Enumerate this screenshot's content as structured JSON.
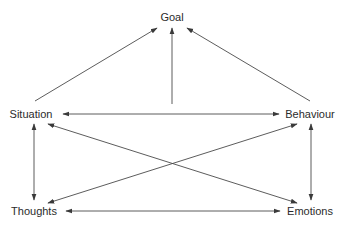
{
  "diagram": {
    "type": "flow-network",
    "nodes": [
      {
        "id": "goal",
        "label": "Goal",
        "x": 172,
        "y": 17
      },
      {
        "id": "situation",
        "label": "Situation",
        "x": 31,
        "y": 114
      },
      {
        "id": "behaviour",
        "label": "Behaviour",
        "x": 310,
        "y": 114
      },
      {
        "id": "thoughts",
        "label": "Thoughts",
        "x": 34,
        "y": 211
      },
      {
        "id": "emotions",
        "label": "Emotions",
        "x": 310,
        "y": 211
      }
    ],
    "edges": [
      {
        "from": "situation",
        "to": "goal",
        "direction": "forward",
        "x1": 35,
        "y1": 101,
        "x2": 157,
        "y2": 28
      },
      {
        "from": "situation-behaviour-link",
        "to": "goal",
        "direction": "forward",
        "x1": 172,
        "y1": 104,
        "x2": 172,
        "y2": 28
      },
      {
        "from": "behaviour",
        "to": "goal",
        "direction": "forward",
        "x1": 310,
        "y1": 101,
        "x2": 187,
        "y2": 28
      },
      {
        "from": "situation",
        "to": "behaviour",
        "direction": "both",
        "x1": 63,
        "y1": 114,
        "x2": 279,
        "y2": 114
      },
      {
        "from": "situation",
        "to": "thoughts",
        "direction": "both",
        "x1": 34,
        "y1": 124,
        "x2": 34,
        "y2": 200
      },
      {
        "from": "behaviour",
        "to": "emotions",
        "direction": "both",
        "x1": 311,
        "y1": 124,
        "x2": 311,
        "y2": 200
      },
      {
        "from": "situation",
        "to": "emotions",
        "direction": "both",
        "x1": 48,
        "y1": 124,
        "x2": 297,
        "y2": 203
      },
      {
        "from": "behaviour",
        "to": "thoughts",
        "direction": "both",
        "x1": 297,
        "y1": 124,
        "x2": 48,
        "y2": 203
      },
      {
        "from": "thoughts",
        "to": "emotions",
        "direction": "both",
        "x1": 66,
        "y1": 211,
        "x2": 280,
        "y2": 211
      }
    ],
    "colors": {
      "line": "#4a4a4a",
      "text": "#2b2b2b",
      "background": "#ffffff"
    }
  }
}
